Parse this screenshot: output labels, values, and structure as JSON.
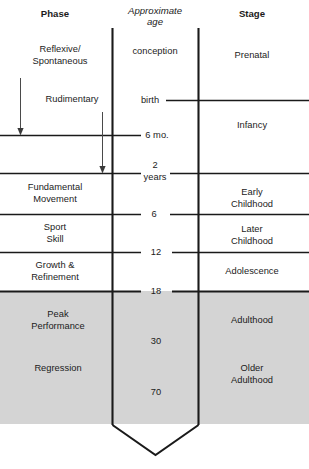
{
  "diagram": {
    "columns": {
      "phase": {
        "header": "Phase"
      },
      "age": {
        "header_line1": "Approximate",
        "header_line2": "age"
      },
      "stage": {
        "header": "Stage"
      }
    },
    "phases": [
      {
        "id": "reflexive-spontaneous",
        "line1": "Reflexive/",
        "line2": "Spontaneous"
      },
      {
        "id": "rudimentary",
        "line1": "Rudimentary",
        "line2": ""
      },
      {
        "id": "fundamental-movement",
        "line1": "Fundamental",
        "line2": "Movement"
      },
      {
        "id": "sport-skill",
        "line1": "Sport",
        "line2": "Skill"
      },
      {
        "id": "growth-refinement",
        "line1": "Growth &",
        "line2": "Refinement"
      },
      {
        "id": "peak-performance",
        "line1": "Peak",
        "line2": "Performance"
      },
      {
        "id": "regression",
        "line1": "Regression",
        "line2": ""
      }
    ],
    "ages": [
      {
        "id": "conception",
        "label": "conception"
      },
      {
        "id": "birth",
        "label": "birth"
      },
      {
        "id": "six-months",
        "label": "6 mo."
      },
      {
        "id": "two-years-line1",
        "label": "2"
      },
      {
        "id": "two-years-line2",
        "label": "years"
      },
      {
        "id": "six-years",
        "label": "6"
      },
      {
        "id": "twelve-years",
        "label": "12"
      },
      {
        "id": "eighteen-years",
        "label": "18"
      },
      {
        "id": "thirty-years",
        "label": "30"
      },
      {
        "id": "seventy-years",
        "label": "70"
      }
    ],
    "stages": [
      {
        "id": "prenatal",
        "line1": "Prenatal",
        "line2": ""
      },
      {
        "id": "infancy",
        "line1": "Infancy",
        "line2": ""
      },
      {
        "id": "early-childhood",
        "line1": "Early",
        "line2": "Childhood"
      },
      {
        "id": "later-childhood",
        "line1": "Later",
        "line2": "Childhood"
      },
      {
        "id": "adolescence",
        "line1": "Adolescence",
        "line2": ""
      },
      {
        "id": "adulthood",
        "line1": "Adulthood",
        "line2": ""
      },
      {
        "id": "older-adulthood",
        "line1": "Older",
        "line2": "Adulthood"
      }
    ],
    "colors": {
      "ink": "#1a1a1a",
      "shaded_region": "#d4d4d4",
      "background": "#ffffff"
    },
    "shading": {
      "note": "Adulthood / older-adulthood band shaded gray from age 18 onward"
    }
  }
}
